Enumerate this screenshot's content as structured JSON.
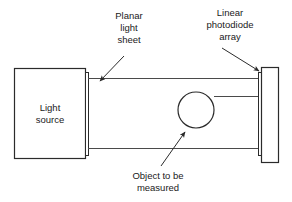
{
  "figure": {
    "background_color": "#ffffff",
    "line_color": "#2b2b2b",
    "beam_color": "#4a4a4a",
    "text_color": "#1a1a1a"
  },
  "components": {
    "light_source": {
      "label_line1": "Light",
      "label_line2": "source",
      "x": 14,
      "y": 68,
      "width": 71,
      "height": 90
    },
    "photodiode_array": {
      "x": 261,
      "y": 67,
      "width": 17,
      "height": 96
    },
    "object": {
      "cx": 196,
      "cy": 110,
      "r": 18
    }
  },
  "callouts": [
    {
      "name": "planar-light-sheet",
      "lines": [
        "Planar",
        "light",
        "sheet"
      ],
      "text_x": 129,
      "text_y": 16,
      "line_height": 12,
      "arrow_from_x": 124,
      "arrow_from_y": 56,
      "arrow_to_x": 99,
      "arrow_to_y": 82
    },
    {
      "name": "linear-photodiode-array",
      "lines": [
        "Linear",
        "photodiode",
        "array"
      ],
      "text_x": 230,
      "text_y": 13,
      "line_height": 12,
      "arrow_from_x": 222,
      "arrow_from_y": 48,
      "arrow_to_x": 260,
      "arrow_to_y": 72
    },
    {
      "name": "object-to-be-measured",
      "lines": [
        "Object to be",
        "measured"
      ],
      "text_x": 158,
      "text_y": 175,
      "line_height": 12,
      "arrow_from_x": 161,
      "arrow_from_y": 166,
      "arrow_to_x": 186,
      "arrow_to_y": 131
    }
  ],
  "beams": {
    "top_line": {
      "x1": 88,
      "y1": 78,
      "x2": 261,
      "y2": 78
    },
    "middle_line": {
      "x1": 214,
      "y1": 96,
      "x2": 261,
      "y2": 96
    },
    "bottom_line": {
      "x1": 88,
      "y1": 148,
      "x2": 261,
      "y2": 148
    }
  },
  "caption": {
    "text": ""
  }
}
